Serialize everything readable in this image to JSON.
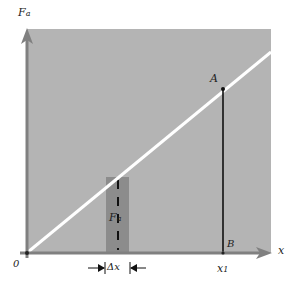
{
  "diagram": {
    "y_axis_label": "F",
    "y_axis_sub": "a",
    "x_axis_label": "x",
    "origin_label": "0",
    "point_a_label": "A",
    "point_b_label": "B",
    "x1_label": "x",
    "x1_sub": "1",
    "bar_label": "F",
    "bar_sub": "a",
    "delta_label": "Δx",
    "colors": {
      "plot_background": "#b4b4b4",
      "bar": "#8c8c8c",
      "line": "#ffffff",
      "axis": "#808080",
      "vertical": "#111111"
    }
  }
}
